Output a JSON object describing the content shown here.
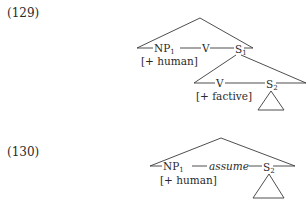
{
  "examples": [
    {
      "number": "(129)",
      "tree": {
        "top_nodes": {
          "np": "NP",
          "np_sub": "1",
          "v": "V",
          "s": "S",
          "s_sub": "1"
        },
        "np_feature": "[+ human]",
        "embedded": {
          "v": "V",
          "s": "S",
          "s_sub": "2",
          "v_feature": "[+ factive]"
        }
      }
    },
    {
      "number": "(130)",
      "tree": {
        "top_nodes": {
          "np": "NP",
          "np_sub": "1",
          "v": "assume",
          "s": "S",
          "s_sub": "2"
        },
        "np_feature": "[+ human]"
      }
    }
  ],
  "colors": {
    "ink": "#2a2a2a",
    "background": "#ffffff"
  }
}
